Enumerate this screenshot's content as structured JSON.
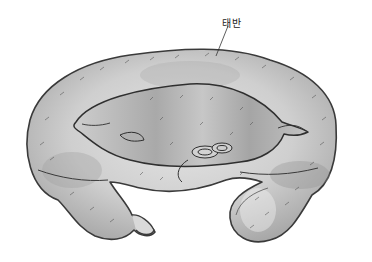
{
  "illustration": {
    "subject": "placenta-with-fetus",
    "labels": [
      {
        "text": "태반",
        "x": 222,
        "y": 15
      }
    ],
    "colors": {
      "background": "#ffffff",
      "placenta_fill": "#c9c9c9",
      "placenta_light": "#e2e2e2",
      "placenta_dark": "#9a9a9a",
      "outline": "#3a3a3a",
      "fetus_fill": "#b8b8b8"
    }
  }
}
